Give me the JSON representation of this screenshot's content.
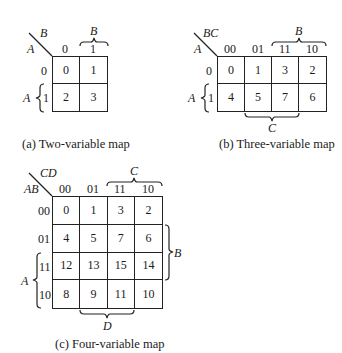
{
  "map2": {
    "corner_col_var": "B",
    "corner_row_var": "A",
    "col_headers": [
      "0",
      "1"
    ],
    "row_headers": [
      "0",
      "1"
    ],
    "cells": [
      [
        "0",
        "1"
      ],
      [
        "2",
        "3"
      ]
    ],
    "brace_top_label": "B",
    "brace_left_label": "A",
    "caption": "(a) Two-variable map"
  },
  "map3": {
    "corner_col_var": "BC",
    "corner_row_var": "A",
    "col_headers": [
      "00",
      "01",
      "11",
      "10"
    ],
    "row_headers": [
      "0",
      "1"
    ],
    "cells": [
      [
        "0",
        "1",
        "3",
        "2"
      ],
      [
        "4",
        "5",
        "7",
        "6"
      ]
    ],
    "brace_top_label": "B",
    "brace_left_label": "A",
    "brace_bottom_label": "C",
    "caption": "(b) Three-variable map"
  },
  "map4": {
    "corner_col_var": "CD",
    "corner_row_var": "AB",
    "col_headers": [
      "00",
      "01",
      "11",
      "10"
    ],
    "row_headers": [
      "00",
      "01",
      "11",
      "10"
    ],
    "cells": [
      [
        "0",
        "1",
        "3",
        "2"
      ],
      [
        "4",
        "5",
        "7",
        "6"
      ],
      [
        "12",
        "13",
        "15",
        "14"
      ],
      [
        "8",
        "9",
        "11",
        "10"
      ]
    ],
    "brace_top_label": "C",
    "brace_left_label": "A",
    "brace_right_label": "B",
    "brace_bottom_label": "D",
    "caption": "(c) Four-variable map"
  }
}
